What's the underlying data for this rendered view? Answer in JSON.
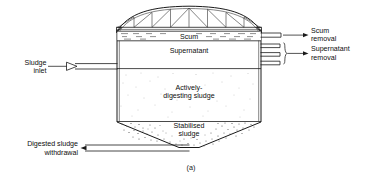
{
  "figure": {
    "caption": "(a)",
    "type": "cross-section-diagram"
  },
  "zones": [
    {
      "id": "scum",
      "label": "Scum",
      "label_lines": [
        "Scum"
      ]
    },
    {
      "id": "supernatant",
      "label": "Supernatant",
      "label_lines": [
        "Supernatant"
      ]
    },
    {
      "id": "digesting",
      "label": "Actively-digesting sludge",
      "label_lines": [
        "Actively-",
        "digesting sludge"
      ]
    },
    {
      "id": "stabilised",
      "label": "Stabilised sludge",
      "label_lines": [
        "Stabilised",
        "sludge"
      ]
    }
  ],
  "annotations": [
    {
      "id": "sludge-inlet",
      "label_lines": [
        "Sludge",
        "inlet"
      ],
      "side": "left",
      "arrow": "right"
    },
    {
      "id": "scum-removal",
      "label_lines": [
        "Scum",
        "removal"
      ],
      "side": "right",
      "arrow": "right"
    },
    {
      "id": "supernatant-removal",
      "label_lines": [
        "Supernatant",
        "removal"
      ],
      "side": "right",
      "arrow": "right"
    },
    {
      "id": "digested-withdrawal",
      "label_lines": [
        "Digested sludge",
        "withdrawal"
      ],
      "side": "left",
      "arrow": "left"
    }
  ],
  "colors": {
    "line": "#1a1a1a",
    "background": "#ffffff",
    "stipple_light": "#9a9a9a",
    "stipple_dense": "#4a4a4a"
  },
  "structure": {
    "roof": "arched-truss",
    "truss_panels": 8,
    "supernatant_draw_off_pipes": 3,
    "scum_draw_off_pipes": 1
  }
}
